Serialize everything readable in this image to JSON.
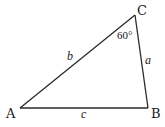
{
  "diagram": {
    "type": "triangle",
    "vertices": {
      "A": {
        "label": "A",
        "x": 20,
        "y": 108
      },
      "B": {
        "label": "B",
        "x": 148,
        "y": 108
      },
      "C": {
        "label": "C",
        "x": 135,
        "y": 15
      }
    },
    "sides": {
      "a": {
        "label": "a",
        "from": "B",
        "to": "C"
      },
      "b": {
        "label": "b",
        "from": "A",
        "to": "C"
      },
      "c": {
        "label": "c",
        "from": "A",
        "to": "B"
      }
    },
    "angles": {
      "C": {
        "label": "60°",
        "vertex": "C"
      }
    },
    "stroke_color": "#2a2a2a",
    "text_color": "#1a1a1a"
  }
}
